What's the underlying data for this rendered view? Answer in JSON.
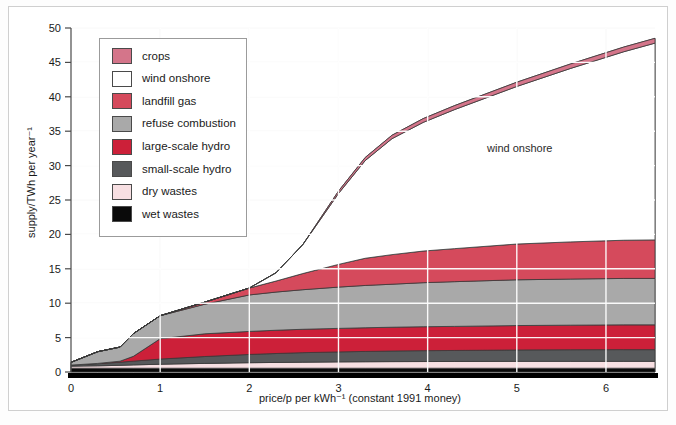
{
  "chart_data": {
    "type": "area",
    "title": "",
    "xlabel": "price/p per kWh⁻¹ (constant 1991 money)",
    "ylabel": "supply/TWh per year⁻¹",
    "xlim": [
      0,
      6.55
    ],
    "ylim": [
      0,
      50
    ],
    "xticks": [
      0,
      1,
      2,
      3,
      4,
      5,
      6
    ],
    "yticks": [
      0,
      5,
      10,
      15,
      20,
      25,
      30,
      35,
      40,
      45,
      50
    ],
    "xtick_labels": [
      "0",
      "1",
      "2",
      "3",
      "4",
      "5",
      "6"
    ],
    "ytick_labels": [
      "0",
      "5",
      "10",
      "15",
      "20",
      "25",
      "30",
      "35",
      "40",
      "45",
      "50"
    ],
    "grid": true,
    "grid_color": "#ffffff",
    "stacked": true,
    "legend_position": "upper-left",
    "annotations": [
      {
        "text": "wind onshore",
        "x": 4.55,
        "y": 31.0
      }
    ],
    "x": [
      0,
      0.3,
      0.55,
      0.7,
      1.0,
      1.5,
      2.0,
      2.3,
      2.6,
      3.0,
      3.3,
      3.6,
      3.95,
      4.3,
      5.0,
      5.6,
      6.2,
      6.55
    ],
    "series": [
      {
        "name": "wet wastes",
        "color": "#0a0a0a",
        "values": [
          0.55,
          0.55,
          0.55,
          0.55,
          0.55,
          0.55,
          0.55,
          0.55,
          0.55,
          0.55,
          0.55,
          0.55,
          0.55,
          0.55,
          0.55,
          0.55,
          0.55,
          0.55
        ]
      },
      {
        "name": "dry wastes",
        "color": "#f7dfe2",
        "values": [
          0.3,
          0.35,
          0.42,
          0.48,
          0.58,
          0.7,
          0.8,
          0.84,
          0.88,
          0.92,
          0.94,
          0.96,
          0.97,
          0.98,
          1.0,
          1.0,
          1.0,
          1.0
        ]
      },
      {
        "name": "small-scale hydro",
        "color": "#57595b",
        "values": [
          0.15,
          0.3,
          0.45,
          0.55,
          0.75,
          1.0,
          1.2,
          1.3,
          1.38,
          1.45,
          1.5,
          1.54,
          1.58,
          1.6,
          1.65,
          1.68,
          1.7,
          1.7
        ]
      },
      {
        "name": "large-scale hydro",
        "color": "#cc2039",
        "values": [
          0.0,
          0.05,
          0.15,
          0.7,
          2.95,
          3.3,
          3.35,
          3.38,
          3.4,
          3.42,
          3.44,
          3.46,
          3.48,
          3.5,
          3.55,
          3.58,
          3.6,
          3.6
        ]
      },
      {
        "name": "refuse combustion",
        "color": "#a9a9a9",
        "values": [
          0.4,
          1.7,
          2.05,
          3.3,
          3.35,
          4.3,
          5.3,
          5.55,
          5.75,
          6.0,
          6.15,
          6.25,
          6.4,
          6.5,
          6.65,
          6.7,
          6.75,
          6.75
        ]
      },
      {
        "name": "landfill gas",
        "color": "#d54a5c",
        "values": [
          0.0,
          0.0,
          0.0,
          0.0,
          0.0,
          0.3,
          1.0,
          1.6,
          2.35,
          3.3,
          3.95,
          4.3,
          4.6,
          4.8,
          5.2,
          5.4,
          5.55,
          5.6
        ]
      },
      {
        "name": "wind onshore",
        "color": "#ffffff",
        "values": [
          0.0,
          0.0,
          0.0,
          0.0,
          0.0,
          0.0,
          0.0,
          1.2,
          4.2,
          10.3,
          14.2,
          16.85,
          18.7,
          20.2,
          22.9,
          25.2,
          27.4,
          28.6
        ]
      },
      {
        "name": "crops",
        "color": "#d4758a",
        "values": [
          0.0,
          0.0,
          0.0,
          0.0,
          0.0,
          0.0,
          0.0,
          0.0,
          0.0,
          0.35,
          0.45,
          0.5,
          0.55,
          0.58,
          0.62,
          0.65,
          0.68,
          0.7
        ]
      }
    ],
    "legend_entries": [
      {
        "label": "crops",
        "color": "#d4758a"
      },
      {
        "label": "wind onshore",
        "color": "#ffffff"
      },
      {
        "label": "landfill gas",
        "color": "#d54a5c"
      },
      {
        "label": "refuse combustion",
        "color": "#a9a9a9"
      },
      {
        "label": "large-scale hydro",
        "color": "#cc2039"
      },
      {
        "label": "small-scale hydro",
        "color": "#57595b"
      },
      {
        "label": "dry wastes",
        "color": "#f7dfe2"
      },
      {
        "label": "wet wastes",
        "color": "#0a0a0a"
      }
    ]
  }
}
